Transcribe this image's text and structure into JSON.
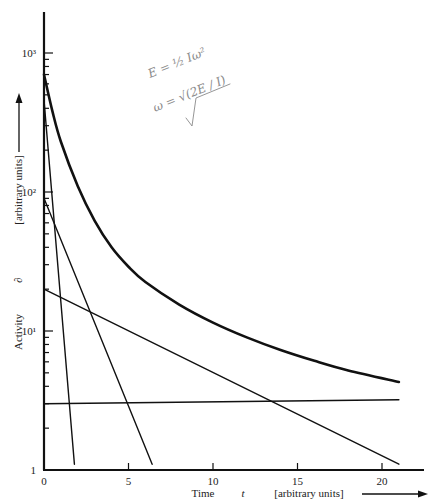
{
  "chart_data": {
    "type": "line",
    "title": "",
    "xlabel": "Time   t   [arbitrary units]",
    "ylabel": "Activity   ∂   [arbitrary units]",
    "x_label_parts": {
      "quantity": "Time",
      "symbol": "t",
      "units": "[arbitrary units]"
    },
    "y_label_parts": {
      "quantity": "Activity",
      "symbol": "∂",
      "units": "[arbitrary units]"
    },
    "x_scale": "linear",
    "y_scale": "log",
    "xlim": [
      0,
      22
    ],
    "ylim": [
      1,
      2000
    ],
    "x_ticks": [
      0,
      5,
      10,
      15,
      20
    ],
    "x_tick_labels": [
      "0",
      "5",
      "10",
      "15",
      "20"
    ],
    "y_ticks": [
      1,
      10,
      100,
      1000
    ],
    "y_tick_labels": [
      "1",
      "10¹",
      "10²",
      "10³"
    ],
    "grid": false,
    "legend": null,
    "series": [
      {
        "name": "total activity (sum)",
        "style": "thick",
        "x": [
          0,
          0.5,
          1,
          2,
          3,
          4,
          5,
          6,
          8,
          10,
          12,
          14,
          16,
          18,
          21
        ],
        "values": [
          700,
          380,
          230,
          110,
          62,
          40,
          29,
          22.5,
          15.5,
          11.5,
          9,
          7.3,
          6.1,
          5.2,
          4.3
        ]
      },
      {
        "name": "component 1 (fastest decay)",
        "style": "thin",
        "x": [
          0,
          1.8
        ],
        "values": [
          460,
          1.1
        ]
      },
      {
        "name": "component 2",
        "style": "thin",
        "x": [
          0,
          6.4
        ],
        "values": [
          90,
          1.1
        ]
      },
      {
        "name": "component 3",
        "style": "thin",
        "x": [
          0,
          21
        ],
        "values": [
          20,
          1.1
        ]
      },
      {
        "name": "component 4 (long-lived)",
        "style": "thin",
        "x": [
          0,
          21
        ],
        "values": [
          3.0,
          3.2
        ]
      }
    ],
    "annotations": [
      {
        "type": "handwritten",
        "text": "E = ½ Iω²"
      },
      {
        "type": "handwritten",
        "text": "ω = √(2E / I)"
      }
    ]
  },
  "axes": {
    "y_arrow": "up-arrow",
    "x_arrow": "right-arrow"
  }
}
